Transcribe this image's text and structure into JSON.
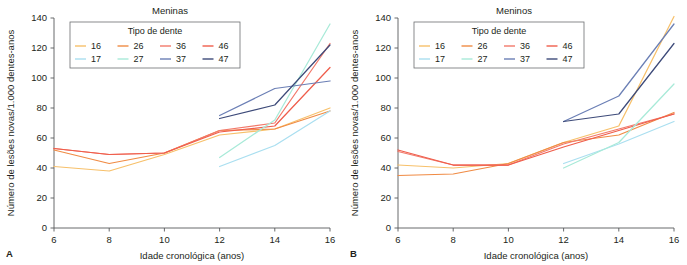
{
  "figure": {
    "panels": [
      {
        "letter": "A",
        "title": "Meninas"
      },
      {
        "letter": "B",
        "title": "Meninos"
      }
    ],
    "legend": {
      "title": "Tipo de dente",
      "entries": [
        {
          "label": "16",
          "color": "#f7c06a"
        },
        {
          "label": "26",
          "color": "#f08b44"
        },
        {
          "label": "36",
          "color": "#f2796a"
        },
        {
          "label": "46",
          "color": "#ef5d4b"
        },
        {
          "label": "17",
          "color": "#aadff0"
        },
        {
          "label": "27",
          "color": "#a8ead8"
        },
        {
          "label": "37",
          "color": "#6b7fb5"
        },
        {
          "label": "47",
          "color": "#3d4a79"
        }
      ]
    },
    "axes": {
      "xlabel": "Idade cronológica (anos)",
      "ylabel": "Número de lesões novas/1.000 dentes-anos",
      "xticks": [
        "6",
        "8",
        "10",
        "12",
        "14",
        "16"
      ],
      "yticks": [
        "0",
        "20",
        "40",
        "60",
        "80",
        "100",
        "120",
        "140"
      ]
    }
  },
  "chart_data": [
    {
      "type": "line",
      "title": "Meninas",
      "panel_letter": "A",
      "xlabel": "Idade cronológica (anos)",
      "ylabel": "Número de lesões novas/1.000 dentes-anos",
      "xlim": [
        6,
        16
      ],
      "ylim": [
        0,
        140
      ],
      "xticks": [
        6,
        8,
        10,
        12,
        14,
        16
      ],
      "yticks": [
        0,
        20,
        40,
        60,
        80,
        100,
        120,
        140
      ],
      "grid": false,
      "legend_title": "Tipo de dente",
      "legend_position": "top-center-inside",
      "series": [
        {
          "name": "16",
          "color": "#f7c06a",
          "x": [
            6,
            8,
            10,
            12,
            14,
            16
          ],
          "values": [
            41,
            38,
            49,
            62,
            66,
            80
          ]
        },
        {
          "name": "26",
          "color": "#f08b44",
          "x": [
            6,
            8,
            10,
            12,
            14,
            16
          ],
          "values": [
            52,
            43,
            50,
            65,
            66,
            78
          ]
        },
        {
          "name": "36",
          "color": "#f2796a",
          "x": [
            6,
            8,
            10,
            12,
            14,
            16
          ],
          "values": [
            53,
            49,
            50,
            65,
            70,
            123
          ]
        },
        {
          "name": "46",
          "color": "#ef5d4b",
          "x": [
            6,
            8,
            10,
            12,
            14,
            16
          ],
          "values": [
            53,
            49,
            50,
            64,
            68,
            107
          ]
        },
        {
          "name": "17",
          "color": "#aadff0",
          "x": [
            12,
            14,
            16
          ],
          "values": [
            41,
            55,
            78
          ]
        },
        {
          "name": "27",
          "color": "#a8ead8",
          "x": [
            12,
            14,
            16
          ],
          "values": [
            47,
            72,
            136
          ]
        },
        {
          "name": "37",
          "color": "#6b7fb5",
          "x": [
            12,
            14,
            16
          ],
          "values": [
            75,
            93,
            98
          ]
        },
        {
          "name": "47",
          "color": "#3d4a79",
          "x": [
            12,
            14,
            16
          ],
          "values": [
            73,
            82,
            122
          ]
        }
      ]
    },
    {
      "type": "line",
      "title": "Meninos",
      "panel_letter": "B",
      "xlabel": "Idade cronológica (anos)",
      "ylabel": "Número de lesões novas/1.000 dentes-anos",
      "xlim": [
        6,
        16
      ],
      "ylim": [
        0,
        140
      ],
      "xticks": [
        6,
        8,
        10,
        12,
        14,
        16
      ],
      "yticks": [
        0,
        20,
        40,
        60,
        80,
        100,
        120,
        140
      ],
      "grid": false,
      "legend_title": "Tipo de dente",
      "legend_position": "top-center-inside",
      "series": [
        {
          "name": "16",
          "color": "#f7c06a",
          "x": [
            6,
            8,
            10,
            12,
            14,
            16
          ],
          "values": [
            42,
            40,
            43,
            57,
            68,
            141
          ]
        },
        {
          "name": "26",
          "color": "#f08b44",
          "x": [
            6,
            8,
            10,
            12,
            14,
            16
          ],
          "values": [
            35,
            36,
            43,
            57,
            62,
            77
          ]
        },
        {
          "name": "36",
          "color": "#f2796a",
          "x": [
            6,
            8,
            10,
            12,
            14,
            16
          ],
          "values": [
            51,
            42,
            42,
            56,
            66,
            76
          ]
        },
        {
          "name": "46",
          "color": "#ef5d4b",
          "x": [
            6,
            8,
            10,
            12,
            14,
            16
          ],
          "values": [
            52,
            42,
            42,
            54,
            65,
            76
          ]
        },
        {
          "name": "17",
          "color": "#aadff0",
          "x": [
            12,
            14,
            16
          ],
          "values": [
            43,
            56,
            71
          ]
        },
        {
          "name": "27",
          "color": "#a8ead8",
          "x": [
            12,
            14,
            16
          ],
          "values": [
            40,
            57,
            96
          ]
        },
        {
          "name": "37",
          "color": "#6b7fb5",
          "x": [
            12,
            14,
            16
          ],
          "values": [
            71,
            88,
            136
          ]
        },
        {
          "name": "47",
          "color": "#3d4a79",
          "x": [
            12,
            14,
            16
          ],
          "values": [
            71,
            76,
            123
          ]
        }
      ]
    }
  ]
}
